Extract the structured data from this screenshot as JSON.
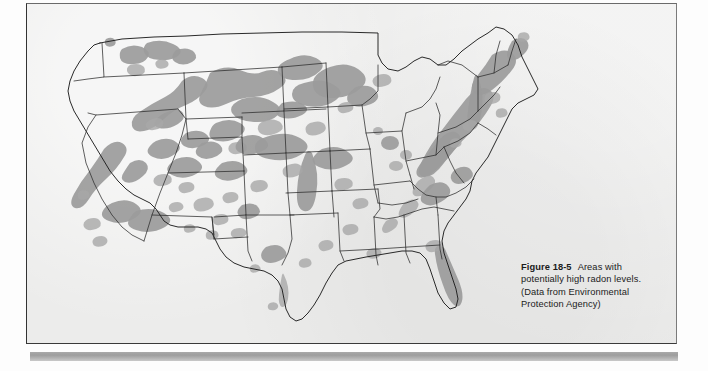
{
  "figure": {
    "label": "Figure 18-5",
    "caption": "Areas with potentially high radon levels. (Data from Environmental Protection Agency)",
    "caption_lines": [
      "Areas with poten-",
      "tially high radon levels. (Data",
      "from Environmental Protection",
      "Agency)"
    ],
    "source": "Environmental Protection Agency",
    "subject": "Areas with potentially high radon levels"
  },
  "map": {
    "title": "United States radon potential map",
    "region": "Contiguous United States",
    "projection": "conic",
    "legend_note": "Shaded gray areas indicate potentially high indoor radon levels",
    "shading_color": "#9b9b9b",
    "outline_color": "#2b2b2b",
    "background_color": "#ececeb",
    "states_shown": 48,
    "high_radon_regions": [
      "Pacific Northwest (Washington, northern Idaho)",
      "Northern Rocky Mountains (Montana, Wyoming)",
      "Sierra Nevada and southern California",
      "Colorado Plateau (Utah, Colorado, Arizona, New Mexico)",
      "Northern Great Plains (Dakotas, Nebraska, Iowa, Minnesota)",
      "Upper Midwest (Wisconsin, Michigan, Illinois, Indiana, Ohio)",
      "Appalachian Highlands (Pennsylvania, Virginia, West Virginia, Carolinas, Tennessee)",
      "New England (New Hampshire, Vermont, Maine, Massachusetts, Connecticut, New York)",
      "Central Florida"
    ]
  },
  "page": {
    "background_color": "#fdfdfd",
    "figure_panel_color": "#ececeb",
    "rule_color": "#a9a9a9"
  }
}
